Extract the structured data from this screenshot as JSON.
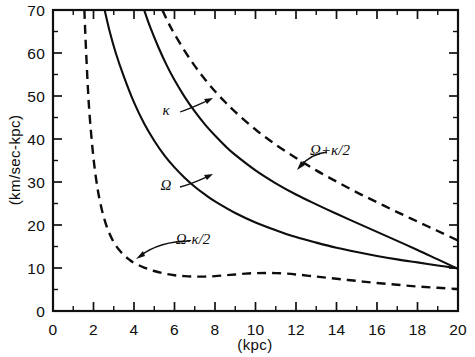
{
  "chart_data": {
    "type": "line",
    "title": "",
    "subtitle": "",
    "xlabel": "(kpc)",
    "ylabel": "(km/sec-kpc)",
    "xlim": [
      0,
      20
    ],
    "ylim": [
      0,
      70
    ],
    "grid": false,
    "legend_position": "inline-annotations",
    "x_ticks_major": [
      0,
      2,
      4,
      6,
      8,
      10,
      12,
      14,
      16,
      18,
      20
    ],
    "x_tick_labels": [
      "0",
      "2",
      "4",
      "6",
      "8",
      "10",
      "12",
      "14",
      "16",
      "18",
      "20"
    ],
    "x_ticks_minor": [
      1,
      3,
      5,
      7,
      9,
      11,
      13,
      15,
      17,
      19
    ],
    "y_ticks_major": [
      0,
      10,
      20,
      30,
      40,
      50,
      60,
      70
    ],
    "y_tick_labels": [
      "0",
      "10",
      "20",
      "30",
      "40",
      "50",
      "60",
      "70"
    ],
    "y_ticks_minor": [
      5,
      15,
      25,
      35,
      45,
      55,
      65
    ],
    "series": [
      {
        "name": "Omega",
        "label": "Ω",
        "style": "solid",
        "x": [
          2.55,
          2.8,
          3.1,
          3.5,
          4.0,
          4.5,
          5.0,
          5.5,
          6.0,
          6.5,
          7.0,
          7.5,
          8.0,
          9.0,
          10.0,
          11.0,
          12.0,
          13.0,
          14.0,
          15.0,
          16.0,
          17.0,
          18.0,
          19.0,
          20.0
        ],
        "y": [
          70.0,
          65.0,
          60.0,
          54.5,
          48.5,
          43.6,
          39.6,
          36.2,
          33.4,
          31.0,
          28.9,
          27.1,
          25.5,
          22.8,
          20.6,
          18.8,
          17.2,
          15.9,
          14.7,
          13.7,
          12.8,
          12.0,
          11.3,
          10.6,
          9.9
        ]
      },
      {
        "name": "Kappa",
        "label": "κ",
        "style": "solid",
        "x": [
          4.5,
          4.8,
          5.2,
          5.6,
          6.0,
          6.5,
          7.0,
          7.5,
          8.0,
          8.5,
          9.0,
          10.0,
          11.0,
          12.0,
          13.0,
          14.0,
          15.0,
          16.0,
          17.0,
          18.0,
          19.0,
          20.0
        ],
        "y": [
          70.0,
          66.0,
          61.4,
          57.3,
          53.7,
          49.8,
          46.4,
          43.4,
          40.8,
          38.4,
          36.3,
          32.7,
          29.7,
          27.1,
          24.8,
          22.6,
          20.5,
          18.4,
          16.3,
          14.2,
          12.0,
          9.8
        ]
      },
      {
        "name": "Omega plus kappa over 2",
        "label": "Ω+κ/2",
        "style": "dashed",
        "x": [
          5.4,
          5.7,
          6.0,
          6.5,
          7.0,
          7.5,
          8.0,
          8.5,
          9.0,
          10.0,
          11.0,
          12.0,
          13.0,
          14.0,
          15.0,
          16.0,
          17.0,
          18.0,
          19.0,
          20.0
        ],
        "y": [
          70.0,
          67.0,
          64.4,
          60.5,
          57.0,
          53.9,
          51.1,
          48.6,
          46.3,
          42.2,
          38.7,
          35.6,
          32.7,
          30.1,
          27.6,
          25.3,
          23.0,
          20.8,
          18.6,
          16.4
        ]
      },
      {
        "name": "Omega minus kappa over 2",
        "label": "Ω-κ/2",
        "style": "dashed",
        "x": [
          1.55,
          1.6,
          1.7,
          1.8,
          2.0,
          2.2,
          2.4,
          2.6,
          2.8,
          3.0,
          3.25,
          3.5,
          3.75,
          4.0,
          4.5,
          5.0,
          5.5,
          6.0,
          6.5,
          7.0,
          7.5,
          8.0,
          8.5,
          9.0,
          9.5,
          10.0,
          10.5,
          11.0,
          11.5,
          12.0,
          13.0,
          14.0,
          15.0,
          16.0,
          17.0,
          18.0,
          19.0,
          20.0
        ],
        "y": [
          70.0,
          64.0,
          54.0,
          46.0,
          35.5,
          28.5,
          23.8,
          20.4,
          17.9,
          16.0,
          14.3,
          13.0,
          12.0,
          11.2,
          10.1,
          9.3,
          8.7,
          8.3,
          8.1,
          8.0,
          8.0,
          8.1,
          8.3,
          8.5,
          8.7,
          8.8,
          8.85,
          8.8,
          8.7,
          8.5,
          8.0,
          7.5,
          7.0,
          6.5,
          6.1,
          5.7,
          5.4,
          5.1
        ]
      }
    ],
    "annotations": [
      {
        "name": "kappa-label",
        "text": "κ",
        "x_px": 166,
        "y_px": 115
      },
      {
        "name": "omega-label",
        "text": "Ω",
        "x_px": 166,
        "y_px": 190
      },
      {
        "name": "omega-minus-label",
        "text": "Ω-κ/2",
        "x_px": 193,
        "y_px": 244
      },
      {
        "name": "omega-plus-label",
        "text": "Ω+κ/2",
        "x_px": 330,
        "y_px": 155
      }
    ]
  },
  "axes": {
    "x_title": "(kpc)",
    "y_title": "(km/sec-kpc)"
  }
}
